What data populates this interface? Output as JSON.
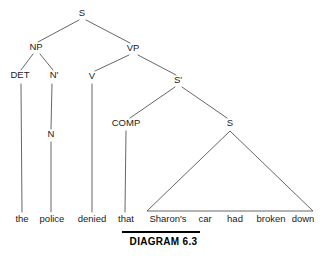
{
  "figure": {
    "type": "syntax-tree",
    "caption": "DIAGRAM 6.3",
    "sentence": "the police denied that Sharon's car had broken down",
    "background_color": "#ffffff",
    "line_color": "#555555",
    "text_color": "#1a1a1a"
  },
  "nodes": {
    "root_s": {
      "label": "S",
      "x": 82,
      "y": 16
    },
    "np": {
      "label": "NP",
      "x": 36,
      "y": 50
    },
    "vp": {
      "label": "VP",
      "x": 133,
      "y": 51
    },
    "det": {
      "label": "DET",
      "x": 20,
      "y": 78
    },
    "nbar": {
      "label": "N'",
      "x": 54,
      "y": 78
    },
    "v": {
      "label": "V",
      "x": 92,
      "y": 79
    },
    "sbar": {
      "label": "S'",
      "x": 178,
      "y": 83
    },
    "n": {
      "label": "N",
      "x": 51,
      "y": 137
    },
    "comp": {
      "label": "COMP",
      "x": 126,
      "y": 126
    },
    "embedded_s": {
      "label": "S",
      "x": 230,
      "y": 126
    }
  },
  "words": [
    {
      "text": "the",
      "x": 22,
      "y": 222
    },
    {
      "text": "police",
      "x": 52,
      "y": 222
    },
    {
      "text": "denied",
      "x": 92,
      "y": 222
    },
    {
      "text": "that",
      "x": 126,
      "y": 222
    },
    {
      "text": "Sharon's",
      "x": 168,
      "y": 222
    },
    {
      "text": "car",
      "x": 205,
      "y": 222
    },
    {
      "text": "had",
      "x": 235,
      "y": 222
    },
    {
      "text": "broken",
      "x": 271,
      "y": 222
    },
    {
      "text": "down",
      "x": 303,
      "y": 222
    }
  ],
  "triangle": {
    "apex_x": 230,
    "apex_y": 131,
    "left_x": 147,
    "left_y": 211,
    "right_x": 313,
    "right_y": 211
  },
  "caption_rule": {
    "x1": 122,
    "x2": 200,
    "y": 232
  }
}
